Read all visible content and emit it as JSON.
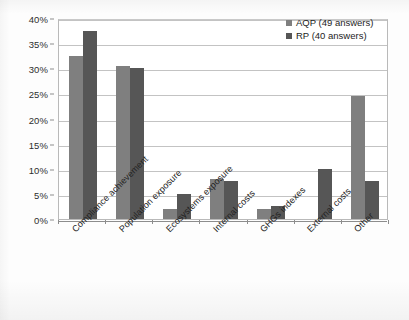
{
  "chart_data": {
    "type": "bar",
    "title": "",
    "subtitle": "",
    "xlabel": "",
    "ylabel": "",
    "ylim": [
      0,
      40
    ],
    "ytick_step": 5,
    "ytick_labels": [
      "0%",
      "5%",
      "10%",
      "15%",
      "20%",
      "25%",
      "30%",
      "35%",
      "40%"
    ],
    "ytick_values": [
      0,
      5,
      10,
      15,
      20,
      25,
      30,
      35,
      40
    ],
    "grid": true,
    "legend_position": "top-right",
    "categories": [
      "Compliance achievement",
      "Population exposure",
      "Ecosystems exposure",
      "Internal costs",
      "GHGs indexes",
      "External costs",
      "Other"
    ],
    "series": [
      {
        "name": "AQP",
        "legend_label": "AQP (49 answers)",
        "answers": 49,
        "color": "#7f7f7f",
        "values": [
          32.5,
          30.5,
          2.0,
          8.0,
          2.0,
          0.0,
          24.5
        ]
      },
      {
        "name": "RP",
        "legend_label": "RP  (40 answers)",
        "answers": 40,
        "color": "#565656",
        "values": [
          37.5,
          30.0,
          5.0,
          7.5,
          2.5,
          10.0,
          7.5
        ]
      }
    ],
    "units": "percent"
  },
  "legend": {
    "items": [
      {
        "label": "AQP (49 answers)",
        "swatch": "legend-swatch-aqp"
      },
      {
        "label": "RP  (40 answers)",
        "swatch": "legend-swatch-rp"
      }
    ]
  },
  "colors": {
    "series_aqp": "#7f7f7f",
    "series_rp": "#565656",
    "gridline": "#c3c3c3",
    "axis": "#8d8d8d",
    "text": "#222222",
    "background": "#fdfdfd"
  }
}
